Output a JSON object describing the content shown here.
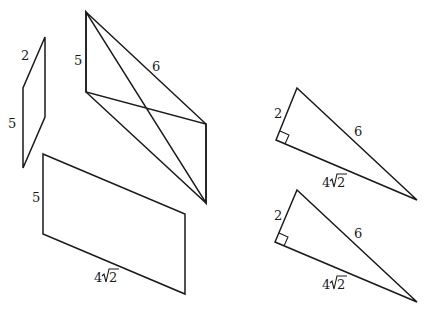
{
  "figure": {
    "shapes": [
      {
        "id": "small-parallelogram",
        "type": "parallelogram",
        "labels": {
          "short_side": "2",
          "long_side": "5"
        }
      },
      {
        "id": "large-parallelogram-top",
        "type": "parallelogram",
        "labels": {
          "vertical_side": "5",
          "slanted_side": "6"
        }
      },
      {
        "id": "large-parallelogram-bottom",
        "type": "parallelogram",
        "labels": {
          "vertical_side": "5",
          "slanted_side": "4√2"
        }
      },
      {
        "id": "right-triangle-top",
        "type": "right-triangle",
        "labels": {
          "leg_short": "2",
          "hypotenuse": "6",
          "leg_long": "4√2"
        }
      },
      {
        "id": "right-triangle-bottom",
        "type": "right-triangle",
        "labels": {
          "leg_short": "2",
          "hypotenuse": "6",
          "leg_long": "4√2"
        }
      }
    ]
  },
  "labels": {
    "p1_short": "2",
    "p1_long": "5",
    "p2_vertical": "5",
    "p2_slant": "6",
    "p3_vertical": "5",
    "p3_coef": "4",
    "p3_rad": "2",
    "t1_short": "2",
    "t1_hyp": "6",
    "t1_coef": "4",
    "t1_rad": "2",
    "t2_short": "2",
    "t2_hyp": "6",
    "t2_coef": "4",
    "t2_rad": "2"
  },
  "colors": {
    "stroke": "#1a1a1a",
    "background": "#ffffff"
  }
}
